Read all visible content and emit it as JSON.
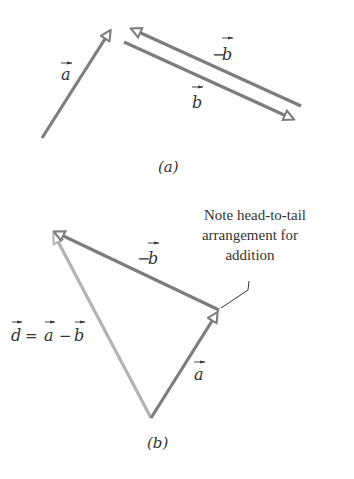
{
  "diagram": {
    "part_a": {
      "caption": "(a)",
      "vectors": [
        {
          "name": "a",
          "label": "a",
          "tail": [
            42,
            138
          ],
          "head": [
            112,
            28
          ],
          "color": "#7d7d7d"
        },
        {
          "name": "b",
          "label": "b",
          "tail": [
            124,
            42
          ],
          "head": [
            296,
            121
          ],
          "color": "#7d7d7d"
        },
        {
          "name": "neg_b",
          "label": "−b",
          "tail": [
            300,
            107
          ],
          "head": [
            128,
            27
          ],
          "color": "#7d7d7d"
        }
      ]
    },
    "part_b": {
      "caption": "(b)",
      "vectors": [
        {
          "name": "a",
          "label": "a",
          "tail": [
            151,
            418
          ],
          "head": [
            220,
            310
          ],
          "color": "#7d7d7d"
        },
        {
          "name": "neg_b",
          "label": "−b",
          "tail": [
            220,
            310
          ],
          "head": [
            52,
            230
          ],
          "color": "#7d7d7d"
        },
        {
          "name": "d",
          "label": "d = a − b",
          "tail": [
            151,
            418
          ],
          "head": [
            52,
            230
          ],
          "color": "#b3b3b3"
        }
      ],
      "note": {
        "lines": [
          "Note head-to-tail",
          "arrangement for",
          "addition"
        ]
      }
    }
  },
  "labels": {
    "a_sym": "a",
    "b_sym": "b",
    "d_sym": "d",
    "minus": "−",
    "equals": "=",
    "cap_a": "(a)",
    "cap_b": "(b)",
    "note1": "Note head-to-tail",
    "note2": "arrangement for",
    "note3": "addition"
  }
}
